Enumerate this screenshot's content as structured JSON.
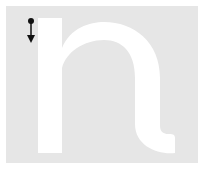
{
  "letter": {
    "character": "n",
    "background_color": "#e6e6e6",
    "glyph_color": "#ffffff",
    "stroke_guide_color": "#111111"
  },
  "stroke_guide": {
    "start_marker": "dot",
    "direction": "down",
    "icon": "arrow-down-icon"
  }
}
